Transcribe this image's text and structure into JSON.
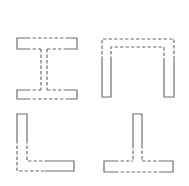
{
  "diagram": {
    "title": "",
    "line_color": "#6e6e6e",
    "background": "#ffffff",
    "shapes": [
      {
        "name": "I-beam",
        "position": "top-left"
      },
      {
        "name": "Channel",
        "position": "top-right"
      },
      {
        "name": "Angle",
        "position": "bottom-left"
      },
      {
        "name": "Tee",
        "position": "bottom-right"
      }
    ]
  }
}
